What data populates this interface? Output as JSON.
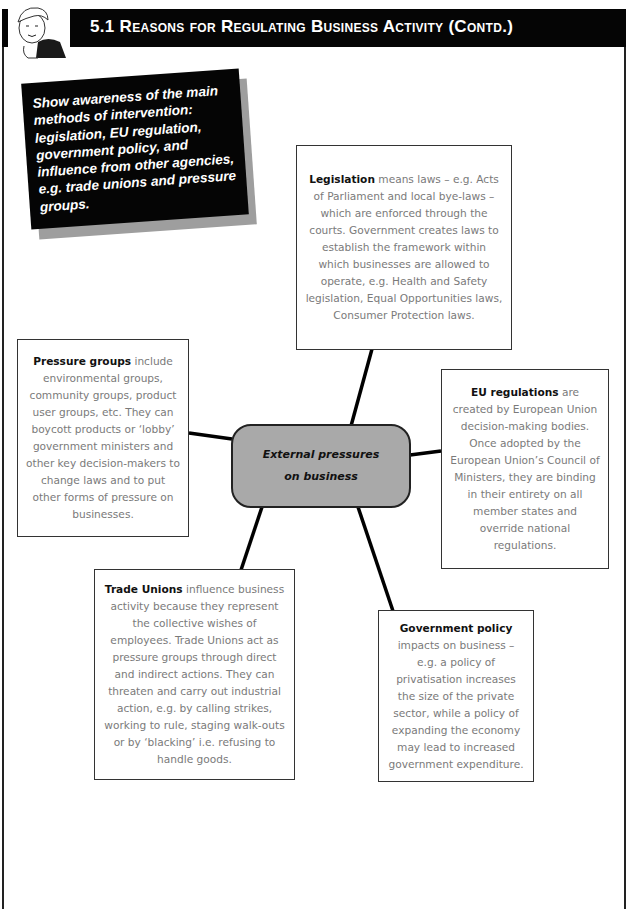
{
  "header": {
    "title": "5.1 Reasons for Regulating Business Activity (Contd.)",
    "background": "#050505"
  },
  "objective": {
    "text": "Show awareness of the main methods of intervention: legislation, EU regulation, government policy, and influence from other agencies, e.g. trade unions and pressure groups."
  },
  "diagram": {
    "hub": {
      "line1": "External pressures",
      "line2": "on business",
      "fill": "#a9a9a9"
    },
    "nodes": [
      {
        "id": "legislation",
        "lead": "Legislation",
        "body": " means laws – e.g. Acts of Parliament and local bye-laws – which are enforced through the courts. Government creates laws to establish the framework within which businesses are allowed to operate, e.g. Health and Safety legislation, Equal Opportunities laws, Consumer Protection laws."
      },
      {
        "id": "eu-regulations",
        "lead": "EU regulations",
        "body": " are created by European Union decision-making bodies. Once adopted by the European Union’s Council of Ministers, they are binding in their entirety on all member states and override national regulations."
      },
      {
        "id": "government-policy",
        "lead": "Government policy",
        "body": " impacts on business – e.g. a policy of privatisation increases the size of the private sector, while a policy of expanding the economy may lead to increased government expenditure."
      },
      {
        "id": "trade-unions",
        "lead": "Trade Unions",
        "body": " influence business activity because they represent the collective wishes of employees. Trade Unions act as pressure groups through direct and indirect actions. They can threaten and carry out industrial action, e.g. by calling strikes, working to rule, staging walk-outs or by ‘blacking’ i.e. refusing to handle goods."
      },
      {
        "id": "pressure-groups",
        "lead": "Pressure groups",
        "body": " include environmental groups, community groups, product user groups, etc. They can boycott products or ‘lobby’ government ministers and other key decision-makers to change laws and to put other forms of pressure on businesses."
      }
    ]
  }
}
